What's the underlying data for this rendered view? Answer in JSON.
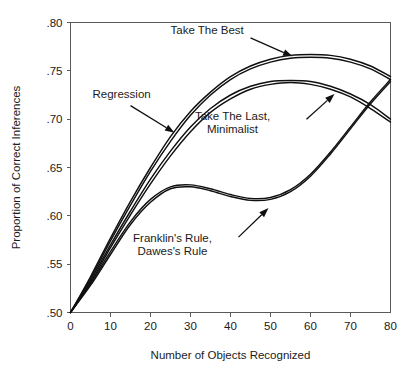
{
  "chart_data": {
    "type": "line",
    "title": "",
    "xlabel": "Number of Objects Recognized",
    "ylabel": "Proportion of Correct Inferences",
    "xlim": [
      0,
      80
    ],
    "ylim": [
      0.5,
      0.8
    ],
    "xticks": [
      0,
      10,
      20,
      30,
      40,
      50,
      60,
      70,
      80
    ],
    "xtick_labels": [
      "0",
      "10",
      "20",
      "30",
      "40",
      "50",
      "60",
      "70",
      "80"
    ],
    "yticks": [
      0.5,
      0.55,
      0.6,
      0.65,
      0.7,
      0.75,
      0.8
    ],
    "ytick_labels": [
      ".50",
      ".55",
      ".60",
      ".65",
      ".70",
      ".75",
      ".80"
    ],
    "grid": false,
    "legend": "annotations",
    "line_color": "#101010",
    "axis_color": "#5a5a5a",
    "x": [
      0,
      5,
      10,
      15,
      20,
      25,
      30,
      35,
      40,
      45,
      50,
      55,
      60,
      65,
      70,
      75,
      80
    ],
    "series": [
      {
        "name": "Take The Best",
        "values": [
          0.5,
          0.537,
          0.577,
          0.615,
          0.65,
          0.682,
          0.708,
          0.728,
          0.744,
          0.755,
          0.762,
          0.766,
          0.767,
          0.766,
          0.762,
          0.755,
          0.744
        ]
      },
      {
        "name": "Regression",
        "values": [
          0.5,
          0.535,
          0.574,
          0.611,
          0.646,
          0.677,
          0.704,
          0.725,
          0.741,
          0.752,
          0.759,
          0.763,
          0.764,
          0.763,
          0.759,
          0.752,
          0.741
        ]
      },
      {
        "name": "Take The Last",
        "values": [
          0.5,
          0.533,
          0.57,
          0.605,
          0.638,
          0.667,
          0.692,
          0.711,
          0.725,
          0.734,
          0.739,
          0.74,
          0.739,
          0.734,
          0.726,
          0.715,
          0.7
        ]
      },
      {
        "name": "Minimalist",
        "values": [
          0.5,
          0.531,
          0.567,
          0.601,
          0.633,
          0.662,
          0.687,
          0.707,
          0.721,
          0.731,
          0.736,
          0.738,
          0.736,
          0.731,
          0.723,
          0.711,
          0.697
        ]
      },
      {
        "name": "Franklin's Rule",
        "values": [
          0.5,
          0.53,
          0.563,
          0.594,
          0.617,
          0.63,
          0.632,
          0.628,
          0.622,
          0.618,
          0.619,
          0.627,
          0.643,
          0.666,
          0.692,
          0.718,
          0.741
        ]
      },
      {
        "name": "Dawes's Rule",
        "values": [
          0.5,
          0.528,
          0.56,
          0.591,
          0.614,
          0.628,
          0.63,
          0.626,
          0.62,
          0.616,
          0.617,
          0.625,
          0.641,
          0.664,
          0.69,
          0.716,
          0.739
        ]
      }
    ],
    "annotations": [
      {
        "id": "take-the-best",
        "label_lines": [
          "Take The Best"
        ],
        "label_x": 25.0,
        "label_y": 0.788,
        "arrow_from_x": 45.0,
        "arrow_from_y": 0.784,
        "arrow_to_x": 55.5,
        "arrow_to_y": 0.765
      },
      {
        "id": "regression",
        "label_lines": [
          "Regression"
        ],
        "label_x": 5.5,
        "label_y": 0.722,
        "arrow_from_x": 15.0,
        "arrow_from_y": 0.714,
        "arrow_to_x": 26.0,
        "arrow_to_y": 0.686
      },
      {
        "id": "take-the-last-minimalist",
        "label_lines": [
          "Take The Last,",
          "Minimalist"
        ],
        "label_x": 40.5,
        "label_y": 0.699,
        "arrow_from_x": 59.0,
        "arrow_from_y": 0.7,
        "arrow_to_x": 66.0,
        "arrow_to_y": 0.726
      },
      {
        "id": "franklins-dawess-rule",
        "label_lines": [
          "Franklin's Rule,",
          "Dawes's Rule"
        ],
        "label_x": 25.5,
        "label_y": 0.573,
        "arrow_from_x": 42.0,
        "arrow_from_y": 0.578,
        "arrow_to_x": 49.5,
        "arrow_to_y": 0.608
      }
    ]
  }
}
